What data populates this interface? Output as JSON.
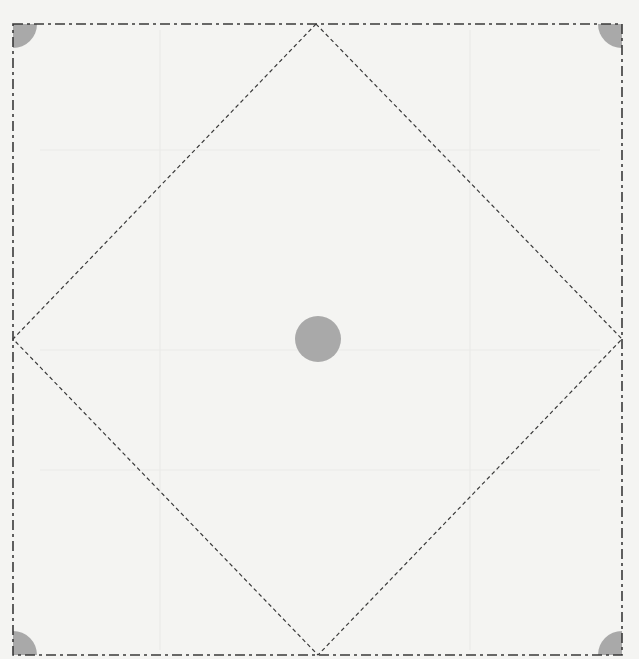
{
  "diagram": {
    "colors": {
      "background": "#f4f4f2",
      "line": "#3a3a3a",
      "fill": "#a9a9a9"
    },
    "square": {
      "x1": 13,
      "y1": 24,
      "x2": 622,
      "y2": 655
    },
    "diamond": {
      "top": [
        316,
        24
      ],
      "right": [
        622,
        339
      ],
      "bottom": [
        318,
        655
      ],
      "left": [
        13,
        339
      ]
    },
    "center_circle": {
      "cx": 318,
      "cy": 339,
      "r": 23
    },
    "corner_radius": 24
  }
}
